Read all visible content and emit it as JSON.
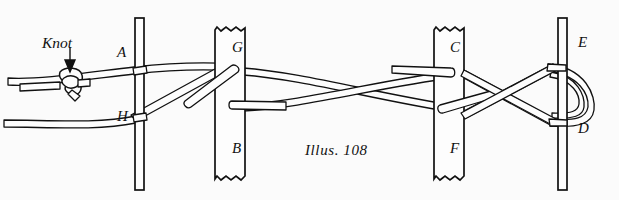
{
  "figure": {
    "caption": "Illus. 108",
    "knot_label": "Knot",
    "background_color": "#fbfbfb",
    "ink_color": "#111111",
    "cord_color": "#fdfdfd",
    "width": 619,
    "height": 200,
    "labels": [
      {
        "id": "A",
        "text": "A",
        "x": 117,
        "y": 57
      },
      {
        "id": "H",
        "text": "H",
        "x": 117,
        "y": 121
      },
      {
        "id": "G",
        "text": "G",
        "x": 232,
        "y": 52
      },
      {
        "id": "B",
        "text": "B",
        "x": 232,
        "y": 153
      },
      {
        "id": "C",
        "text": "C",
        "x": 450,
        "y": 52
      },
      {
        "id": "F",
        "text": "F",
        "x": 450,
        "y": 153
      },
      {
        "id": "E",
        "text": "E",
        "x": 578,
        "y": 47
      },
      {
        "id": "D",
        "text": "D",
        "x": 578,
        "y": 133
      }
    ],
    "posts": [
      {
        "name": "post-left-narrow",
        "x": 135,
        "top": 18,
        "bottom": 190,
        "width": 9,
        "torn": false
      },
      {
        "name": "post-gb",
        "x": 215,
        "top": 28,
        "bottom": 180,
        "width": 30,
        "torn": true
      },
      {
        "name": "post-cf",
        "x": 434,
        "top": 28,
        "bottom": 180,
        "width": 30,
        "torn": true
      },
      {
        "name": "post-ed",
        "x": 558,
        "top": 18,
        "bottom": 190,
        "width": 9,
        "torn": false
      }
    ],
    "knot": {
      "name": "overhand-knot",
      "x": 68,
      "y": 82
    },
    "arrow": {
      "name": "knot-pointer-arrow",
      "x": 70,
      "from_y": 50,
      "to_y": 70
    }
  }
}
